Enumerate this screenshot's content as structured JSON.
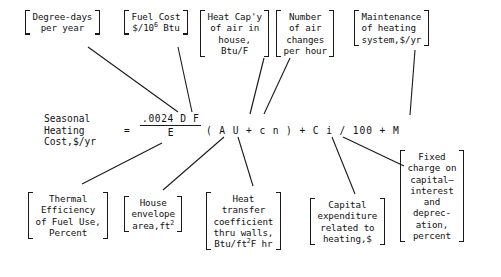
{
  "figure": {
    "line_color": "#1a1a1a",
    "background": "#ffffff"
  },
  "equation": {
    "lhs_line1": "Seasonal",
    "lhs_line2": "Heating",
    "lhs_line3": "Cost,$/yr",
    "equals": "=",
    "fraction_numerator": ".0024 D F",
    "fraction_denominator": "E",
    "rhs": "( A U + c n ) + C i / 100 + M"
  },
  "top_annotations": [
    {
      "id": "degree-days",
      "line1": "Degree-days",
      "line2": "per year",
      "symbol": "D"
    },
    {
      "id": "fuel-cost",
      "line1": "Fuel Cost",
      "line2_pre": "$/10",
      "line2_sup": "6",
      "line2_post": " Btu",
      "symbol": "F"
    },
    {
      "id": "heat-capacity",
      "line1": "Heat Cap'y",
      "line2": "of air in",
      "line3": "house,",
      "line4": "Btu/F",
      "symbol": "c"
    },
    {
      "id": "air-changes",
      "line1": "Number",
      "line2": "of air",
      "line3": "changes",
      "line4": "per hour",
      "symbol": "n"
    },
    {
      "id": "maintenance",
      "line1": "Maintenance",
      "line2": "of heating",
      "line3": "system,$/yr",
      "symbol": "M"
    }
  ],
  "bottom_annotations": [
    {
      "id": "thermal-efficiency",
      "line1": "Thermal",
      "line2": "Efficiency",
      "line3": "of Fuel Use,",
      "line4": "Percent",
      "symbol": "E"
    },
    {
      "id": "house-envelope",
      "line1": "House",
      "line2": "envelope",
      "line3_pre": "area,ft",
      "line3_sup": "2",
      "symbol": "A"
    },
    {
      "id": "heat-transfer-coefficient",
      "line1": "Heat",
      "line2": "transfer",
      "line3": "coefficient",
      "line4": "thru walls,",
      "line5_pre": "Btu/ft",
      "line5_sup": "2",
      "line5_post": "F hr",
      "symbol": "U"
    },
    {
      "id": "capital-expenditure",
      "line1": "Capital",
      "line2": "expenditure",
      "line3": "related to",
      "line4": "heating,$",
      "symbol": "C"
    },
    {
      "id": "fixed-charge",
      "line1": "Fixed",
      "line2": "charge on",
      "line3": "capital—",
      "line4": "interest",
      "line5": "and",
      "line6": "deprec-",
      "line7": "ation,",
      "line8": "percent",
      "symbol": "i"
    }
  ]
}
